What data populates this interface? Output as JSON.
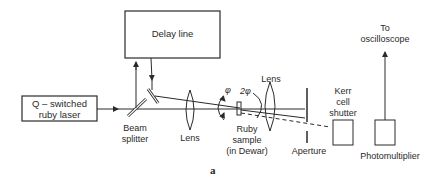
{
  "diagram": {
    "type": "optical-setup",
    "figure_label": "a",
    "components": {
      "delay_line": {
        "label": "Delay line"
      },
      "laser": {
        "label_line1": "Q – switched",
        "label_line2": "ruby laser"
      },
      "beam_splitter": {
        "label_line1": "Beam",
        "label_line2": "splitter"
      },
      "lens1": {
        "label": "Lens"
      },
      "ruby_sample": {
        "label_line1": "Ruby",
        "label_line2": "sample",
        "label_line3": "(in Dewar)"
      },
      "lens2": {
        "label": "Lens"
      },
      "aperture": {
        "label": "Aperture"
      },
      "kerr_cell": {
        "label_line1": "Kerr",
        "label_line2": "cell",
        "label_line3": "shutter"
      },
      "photomultiplier": {
        "label": "Photomultiplier"
      },
      "oscilloscope": {
        "label_line1": "To",
        "label_line2": "oscilloscope"
      }
    },
    "angles": {
      "phi": "φ",
      "two_phi": "2φ"
    },
    "colors": {
      "line": "#2a2a2a",
      "background": "#ffffff"
    }
  }
}
